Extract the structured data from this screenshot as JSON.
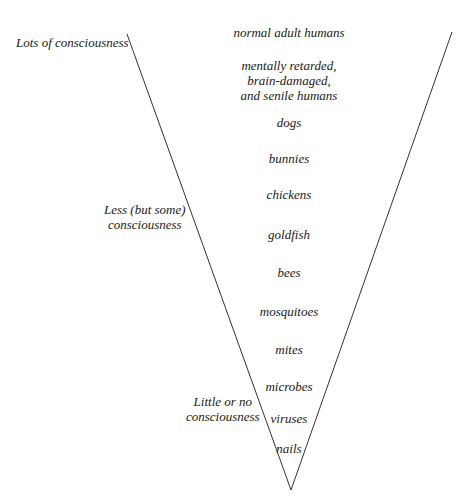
{
  "diagram": {
    "type": "inverted-triangle-scale",
    "scale_labels": {
      "top": "Lots of consciousness",
      "middle_line1": "Less (but some)",
      "middle_line2": "consciousness",
      "bottom_line1": "Little or no",
      "bottom_line2": "consciousness"
    },
    "items": [
      {
        "line1": "normal adult humans"
      },
      {
        "line1": "mentally retarded,",
        "line2": "brain-damaged,",
        "line3": "and senile humans"
      },
      {
        "line1": "dogs"
      },
      {
        "line1": "bunnies"
      },
      {
        "line1": "chickens"
      },
      {
        "line1": "goldfish"
      },
      {
        "line1": "bees"
      },
      {
        "line1": "mosquitoes"
      },
      {
        "line1": "mites"
      },
      {
        "line1": "microbes"
      },
      {
        "line1": "viruses"
      },
      {
        "line1": "nails"
      }
    ],
    "line_color": "#333333"
  }
}
